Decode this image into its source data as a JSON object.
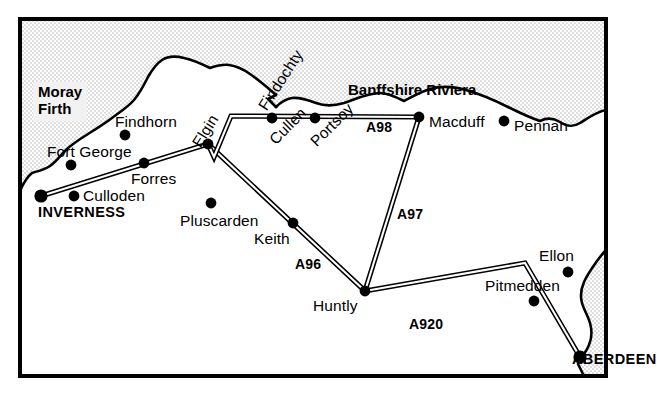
{
  "map": {
    "title": "North East Scotland road map",
    "frame": {
      "x": 18,
      "y": 17,
      "width": 590,
      "height": 361,
      "border_color": "#000000",
      "border_width": 4
    },
    "colors": {
      "land": "#ffffff",
      "sea": "#e8e8e8",
      "ink": "#000000",
      "label_box": "#f2f2f2"
    },
    "water_labels": [
      {
        "id": "moray-firth",
        "line1": "Moray",
        "line2": "Firth",
        "x": 33,
        "y": 82
      }
    ],
    "region_labels": [
      {
        "id": "banffshire-riviera",
        "text": "Banffshire Riviera",
        "x": 348,
        "y": 82
      }
    ],
    "settlements": [
      {
        "id": "inverness",
        "label": "INVERNESS",
        "kind": "city",
        "dot_x": 41,
        "dot_y": 196,
        "label_x": 38,
        "label_y": 205,
        "rotation": 0,
        "anchor": "start"
      },
      {
        "id": "aberdeen",
        "label": "ABERDEEN",
        "kind": "city",
        "dot_x": 580,
        "dot_y": 357,
        "label_x": 572,
        "label_y": 352,
        "rotation": 0,
        "anchor": "end"
      },
      {
        "id": "fort-george",
        "label": "Fort George",
        "kind": "town",
        "dot_x": 71,
        "dot_y": 165,
        "label_x": 47,
        "label_y": 144,
        "rotation": 0,
        "anchor": "start"
      },
      {
        "id": "culloden",
        "label": "Culloden",
        "kind": "town",
        "dot_x": 74,
        "dot_y": 196,
        "label_x": 83,
        "label_y": 188,
        "rotation": 0,
        "anchor": "start"
      },
      {
        "id": "findhorn",
        "label": "Findhorn",
        "kind": "town",
        "dot_x": 125,
        "dot_y": 135,
        "label_x": 115,
        "label_y": 114,
        "rotation": 0,
        "anchor": "start"
      },
      {
        "id": "forres",
        "label": "Forres",
        "kind": "town",
        "dot_x": 144,
        "dot_y": 163,
        "label_x": 131,
        "label_y": 171,
        "rotation": 0,
        "anchor": "start"
      },
      {
        "id": "elgin",
        "label": "Elgin",
        "kind": "town",
        "dot_x": 208,
        "dot_y": 144,
        "label_x": 196,
        "label_y": 138,
        "rotation": -58,
        "anchor": "start"
      },
      {
        "id": "pluscarden",
        "label": "Pluscarden",
        "kind": "town",
        "dot_x": 211,
        "dot_y": 203,
        "label_x": 180,
        "label_y": 213,
        "rotation": 0,
        "anchor": "start"
      },
      {
        "id": "keith",
        "label": "Keith",
        "kind": "town",
        "dot_x": 293,
        "dot_y": 223,
        "label_x": 254,
        "label_y": 231,
        "rotation": 0,
        "anchor": "start"
      },
      {
        "id": "huntly",
        "label": "Huntly",
        "kind": "town",
        "dot_x": 365,
        "dot_y": 291,
        "label_x": 313,
        "label_y": 298,
        "rotation": 0,
        "anchor": "start"
      },
      {
        "id": "findochty",
        "label": "Findochty",
        "kind": "town",
        "dot_x": 0,
        "dot_y": 0,
        "label_x": 262,
        "label_y": 101,
        "rotation": -57,
        "anchor": "start"
      },
      {
        "id": "cullen",
        "label": "Cullen",
        "kind": "town",
        "dot_x": 272,
        "dot_y": 118,
        "label_x": 272,
        "label_y": 134,
        "rotation": -45,
        "anchor": "start"
      },
      {
        "id": "portsoy",
        "label": "Portsoy",
        "kind": "town",
        "dot_x": 315,
        "dot_y": 118,
        "label_x": 313,
        "label_y": 136,
        "rotation": -45,
        "anchor": "start"
      },
      {
        "id": "macduff",
        "label": "Macduff",
        "kind": "town",
        "dot_x": 419,
        "dot_y": 117,
        "label_x": 429,
        "label_y": 114,
        "rotation": 0,
        "anchor": "start"
      },
      {
        "id": "pennan",
        "label": "Pennan",
        "kind": "town",
        "dot_x": 504,
        "dot_y": 121,
        "label_x": 514,
        "label_y": 118,
        "rotation": 0,
        "anchor": "start"
      },
      {
        "id": "ellon",
        "label": "Ellon",
        "kind": "town",
        "dot_x": 568,
        "dot_y": 272,
        "label_x": 539,
        "label_y": 248,
        "rotation": 0,
        "anchor": "start"
      },
      {
        "id": "pitmedden",
        "label": "Pitmedden",
        "kind": "town",
        "dot_x": 534,
        "dot_y": 301,
        "label_x": 485,
        "label_y": 278,
        "rotation": 0,
        "anchor": "start"
      }
    ],
    "roads": [
      {
        "id": "a96",
        "label": "A96",
        "label_x": 295,
        "label_y": 257,
        "path": "M 41 196 L 208 144 L 365 291"
      },
      {
        "id": "a98",
        "label": "A98",
        "label_x": 366,
        "label_y": 120,
        "path": "M 208 144 L 214 156 L 231 116 L 419 117"
      },
      {
        "id": "a97",
        "label": "A97",
        "label_x": 397,
        "label_y": 207,
        "path": "M 419 117 L 365 291"
      },
      {
        "id": "a920",
        "label": "A920",
        "label_x": 409,
        "label_y": 317,
        "path": "M 365 291 L 525 263 L 580 357"
      }
    ]
  }
}
